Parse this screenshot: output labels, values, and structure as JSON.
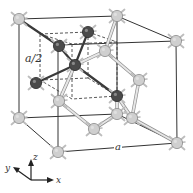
{
  "figure": {
    "labels": {
      "half_lattice": "a/2",
      "lattice_constant": "a",
      "axis_x": "x",
      "axis_y": "y",
      "axis_z": "z"
    },
    "colors": {
      "light_atom": "#cfcfcf",
      "light_atom_stroke": "#8a8a8a",
      "dark_atom": "#4a4a4a",
      "dark_atom_stroke": "#2a2a2a",
      "cube_edge": "#333333",
      "light_bond": "#b5b5b5",
      "dark_bond": "#3a3a3a",
      "stub": "#bdbdbd"
    },
    "cube": {
      "back_face": [
        [
          19,
          19
        ],
        [
          117,
          16
        ],
        [
          117,
          114
        ],
        [
          19,
          118
        ]
      ],
      "front_face": [
        [
          58,
          45
        ],
        [
          176,
          41
        ],
        [
          177,
          143
        ],
        [
          58,
          152
        ]
      ]
    },
    "sub_cube_dashed": {
      "top": [
        [
          40,
          34
        ],
        [
          88,
          32
        ],
        [
          117,
          42
        ],
        [
          72,
          44
        ]
      ],
      "bottom": [
        [
          40,
          80
        ],
        [
          88,
          78
        ],
        [
          117,
          96
        ],
        [
          72,
          99
        ]
      ]
    },
    "light_atoms": [
      [
        19,
        19
      ],
      [
        117,
        16
      ],
      [
        176,
        41
      ],
      [
        19,
        118
      ],
      [
        58,
        152
      ],
      [
        177,
        143
      ],
      [
        105,
        51
      ],
      [
        139,
        80
      ],
      [
        59,
        101
      ],
      [
        117,
        114
      ],
      [
        132,
        118
      ],
      [
        94,
        129
      ]
    ],
    "dark_atoms": [
      [
        88,
        32
      ],
      [
        59,
        46
      ],
      [
        75,
        65
      ],
      [
        36,
        83
      ],
      [
        117,
        96
      ]
    ],
    "dark_bonds": [
      [
        [
          75,
          65
        ],
        [
          88,
          32
        ]
      ],
      [
        [
          75,
          65
        ],
        [
          59,
          46
        ]
      ],
      [
        [
          75,
          65
        ],
        [
          36,
          83
        ]
      ],
      [
        [
          75,
          65
        ],
        [
          117,
          96
        ]
      ],
      [
        [
          59,
          46
        ],
        [
          19,
          19
        ]
      ]
    ],
    "light_bonds": [
      [
        [
          117,
          16
        ],
        [
          105,
          51
        ]
      ],
      [
        [
          105,
          51
        ],
        [
          139,
          80
        ]
      ],
      [
        [
          139,
          80
        ],
        [
          132,
          118
        ]
      ],
      [
        [
          132,
          118
        ],
        [
          177,
          143
        ]
      ],
      [
        [
          117,
          114
        ],
        [
          94,
          129
        ]
      ],
      [
        [
          94,
          129
        ],
        [
          59,
          101
        ]
      ],
      [
        [
          59,
          101
        ],
        [
          75,
          65
        ]
      ],
      [
        [
          117,
          96
        ],
        [
          117,
          114
        ]
      ],
      [
        [
          117,
          96
        ],
        [
          132,
          118
        ]
      ],
      [
        [
          105,
          51
        ],
        [
          75,
          65
        ]
      ]
    ]
  }
}
